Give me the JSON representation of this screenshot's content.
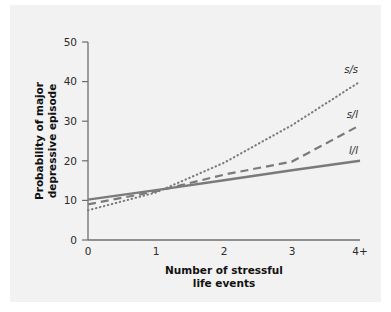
{
  "figure": {
    "background_color": "#ffffff",
    "panel_color": "#f2f2f2"
  },
  "chart_data": {
    "type": "line",
    "title": "",
    "subtitle": "",
    "xlabel_line1": "Number of stressful",
    "xlabel_line2": "life events",
    "ylabel_line1": "Probability of major",
    "ylabel_line2": "depressive episode",
    "x": [
      0,
      1,
      2,
      3,
      4
    ],
    "xticklabels": [
      "0",
      "1",
      "2",
      "3",
      "4+"
    ],
    "yticklabels": [
      "0",
      "10",
      "20",
      "30",
      "40",
      "50"
    ],
    "yticks": [
      0,
      10,
      20,
      30,
      40,
      50
    ],
    "xlim": [
      0,
      4
    ],
    "ylim": [
      0,
      50
    ],
    "grid": false,
    "legend_position": "right-inline",
    "line_color": "#7a7a7a",
    "series": [
      {
        "name": "s/s",
        "label": "s/s",
        "style": "dotted",
        "color": "#7a7a7a",
        "values": [
          7.5,
          12.0,
          19.5,
          29.0,
          40.0
        ],
        "label_x": 4.0,
        "label_y": 43.0
      },
      {
        "name": "s/l",
        "label": "s/l",
        "style": "dashed",
        "color": "#7a7a7a",
        "values": [
          9.0,
          12.3,
          16.5,
          19.8,
          29.0
        ],
        "label_x": 4.0,
        "label_y": 31.5
      },
      {
        "name": "l/l",
        "label": "l/l",
        "style": "solid",
        "color": "#7a7a7a",
        "values": [
          10.2,
          12.6,
          15.1,
          17.6,
          20.0
        ],
        "label_x": 4.0,
        "label_y": 22.5
      }
    ]
  },
  "axes": {
    "y_tick_0": "0",
    "y_tick_10": "10",
    "y_tick_20": "20",
    "y_tick_30": "30",
    "y_tick_40": "40",
    "y_tick_50": "50",
    "x_tick_0": "0",
    "x_tick_1": "1",
    "x_tick_2": "2",
    "x_tick_3": "3",
    "x_tick_4": "4+"
  }
}
